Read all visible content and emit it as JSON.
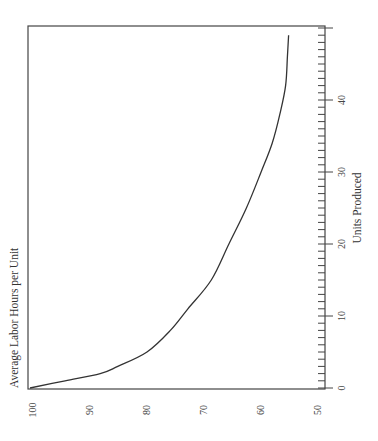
{
  "chart_data": {
    "type": "line",
    "orientation": "rotated 90 degrees counter-clockwise (x-axis runs vertically on right, y-axis along bottom)",
    "title": "",
    "xlabel": "Units Produced",
    "ylabel": "Average Labor Hours per Unit",
    "xlim": [
      0,
      50
    ],
    "ylim": [
      50,
      100
    ],
    "x_ticks": [
      0,
      10,
      20,
      30,
      40
    ],
    "x_minor_tick_step": 1,
    "y_ticks": [
      100,
      90,
      80,
      70,
      60,
      50
    ],
    "grid": false,
    "legend": null,
    "series": [
      {
        "name": "Learning curve",
        "x": [
          0,
          1,
          2,
          3,
          5,
          8,
          11,
          15,
          20,
          25,
          30,
          34,
          38,
          42,
          46,
          49
        ],
        "values": [
          100,
          94,
          88,
          85,
          80,
          76,
          73,
          69,
          66,
          63,
          60.5,
          58.6,
          57.3,
          56.3,
          56,
          55.8
        ]
      }
    ]
  }
}
